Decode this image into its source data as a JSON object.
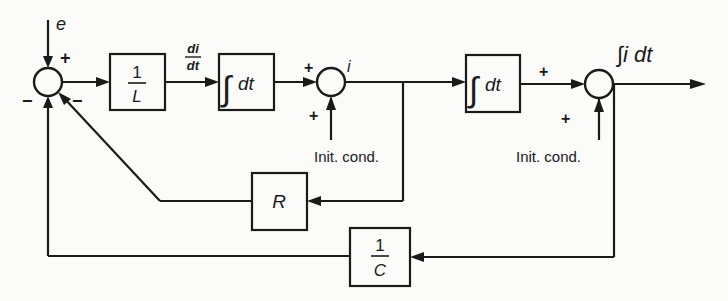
{
  "diagram": {
    "type": "block-diagram",
    "input_label": "e",
    "output_label": "∫i dt",
    "derivative_label_num": "di",
    "derivative_label_den": "dt",
    "current_label": "i",
    "blocks": {
      "inv_L": {
        "num": "1",
        "den": "L"
      },
      "integrator1": {
        "symbol": "∫",
        "label": "dt"
      },
      "integrator2": {
        "symbol": "∫",
        "label": "dt"
      },
      "R": {
        "label": "R"
      },
      "inv_C": {
        "num": "1",
        "den": "C"
      }
    },
    "summing_junctions": {
      "main": {
        "signs": {
          "input_e": "+",
          "from_R": "−",
          "from_C": "−"
        }
      },
      "init1": {
        "signs": {
          "forward": "+",
          "init": "+"
        },
        "init_label": "Init. cond."
      },
      "init2": {
        "signs": {
          "forward": "+",
          "init": "+"
        },
        "init_label": "Init. cond."
      }
    }
  }
}
